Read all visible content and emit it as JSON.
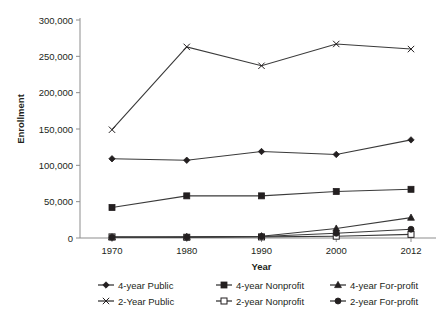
{
  "chart_data": {
    "type": "line",
    "title": "",
    "xlabel": "Year",
    "ylabel": "Enrollment",
    "categories": [
      "1970",
      "1980",
      "1990",
      "2000",
      "2012"
    ],
    "x": [
      1970,
      1980,
      1990,
      2000,
      2012
    ],
    "ylim": [
      0,
      300000
    ],
    "yticks": [
      0,
      50000,
      100000,
      150000,
      200000,
      250000,
      300000
    ],
    "ytick_labels": [
      "0",
      "50,000",
      "100,000",
      "150,000",
      "200,000",
      "250,000",
      "300,000"
    ],
    "grid": false,
    "legend_position": "bottom",
    "series": [
      {
        "name": "4-year Public",
        "marker": "diamond",
        "values": [
          109000,
          107000,
          119000,
          115000,
          135000
        ]
      },
      {
        "name": "4-year Nonprofit",
        "marker": "square-filled",
        "values": [
          42000,
          58000,
          58000,
          64000,
          67000
        ]
      },
      {
        "name": "4-year For-profit",
        "marker": "triangle",
        "values": [
          1000,
          1500,
          2500,
          13000,
          28000
        ]
      },
      {
        "name": "2-Year Public",
        "marker": "x",
        "values": [
          149000,
          263000,
          237000,
          267000,
          260000
        ]
      },
      {
        "name": "2-year Nonprofit",
        "marker": "square-open",
        "values": [
          1500,
          1000,
          1500,
          2500,
          5000
        ]
      },
      {
        "name": "2-year For-profit",
        "marker": "circle-filled",
        "values": [
          1000,
          1200,
          2000,
          6500,
          12000
        ]
      }
    ]
  },
  "legend": {
    "entries": [
      {
        "label": "4-year Public",
        "marker": "diamond"
      },
      {
        "label": "4-year Nonprofit",
        "marker": "square-filled"
      },
      {
        "label": "4-year For-profit",
        "marker": "triangle"
      },
      {
        "label": "2-Year Public",
        "marker": "x"
      },
      {
        "label": "2-year Nonprofit",
        "marker": "square-open"
      },
      {
        "label": "2-year For-profit",
        "marker": "circle-filled"
      }
    ]
  },
  "colors": {
    "line": "#3a3a3a",
    "marker": "#231f20",
    "axis": "#8d8d8d",
    "text": "#231f20",
    "background": "#ffffff"
  }
}
